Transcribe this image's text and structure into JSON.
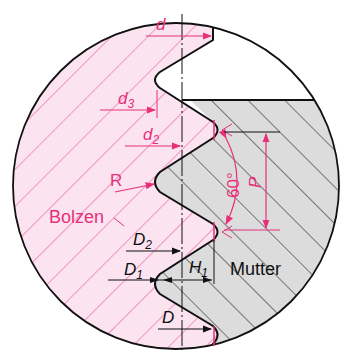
{
  "diagram": {
    "colors": {
      "bolt_fill": "#fbe3f0",
      "bolt_hatch": "#e8559a",
      "nut_fill": "#dcdcdc",
      "nut_hatch": "#222222",
      "outline": "#111111",
      "dimension_red": "#e8307a",
      "dimension_black": "#111111"
    },
    "labels": {
      "bolt": "Bolzen",
      "nut": "Mutter",
      "d": "d",
      "d3": "d",
      "d3_sub": "3",
      "d2": "d",
      "d2_sub": "2",
      "R": "R",
      "angle": "60°",
      "P": "P",
      "D2": "D",
      "D2_sub": "2",
      "D1": "D",
      "D1_sub": "1",
      "H1": "H",
      "H1_sub": "1",
      "D": "D"
    }
  }
}
